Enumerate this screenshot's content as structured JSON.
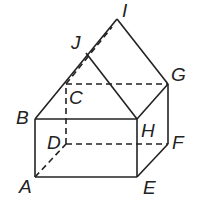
{
  "figure": {
    "type": "3D solid: rectangular prism with triangular prism roof",
    "vertices": {
      "A": {
        "label": "A",
        "x": 35,
        "y": 177
      },
      "B": {
        "label": "B",
        "x": 35,
        "y": 119
      },
      "C": {
        "label": "C",
        "x": 66,
        "y": 84
      },
      "D": {
        "label": "D",
        "x": 66,
        "y": 144
      },
      "E": {
        "label": "E",
        "x": 137,
        "y": 177
      },
      "F": {
        "label": "F",
        "x": 168,
        "y": 144
      },
      "G": {
        "label": "G",
        "x": 168,
        "y": 84
      },
      "H": {
        "label": "H",
        "x": 137,
        "y": 119
      },
      "I": {
        "label": "I",
        "x": 117,
        "y": 19
      },
      "J": {
        "label": "J",
        "x": 86,
        "y": 53
      }
    },
    "solid_edges": [
      [
        "A",
        "B"
      ],
      [
        "B",
        "H"
      ],
      [
        "H",
        "E"
      ],
      [
        "A",
        "E"
      ],
      [
        "E",
        "F"
      ],
      [
        "F",
        "G"
      ],
      [
        "H",
        "G"
      ],
      [
        "B",
        "I"
      ],
      [
        "I",
        "G"
      ],
      [
        "J",
        "H"
      ]
    ],
    "hidden_edges": [
      [
        "A",
        "D"
      ],
      [
        "D",
        "F"
      ],
      [
        "D",
        "C"
      ],
      [
        "C",
        "G"
      ],
      [
        "C",
        "I"
      ]
    ],
    "colors": {
      "line": "#222222",
      "background": "#ffffff"
    }
  }
}
